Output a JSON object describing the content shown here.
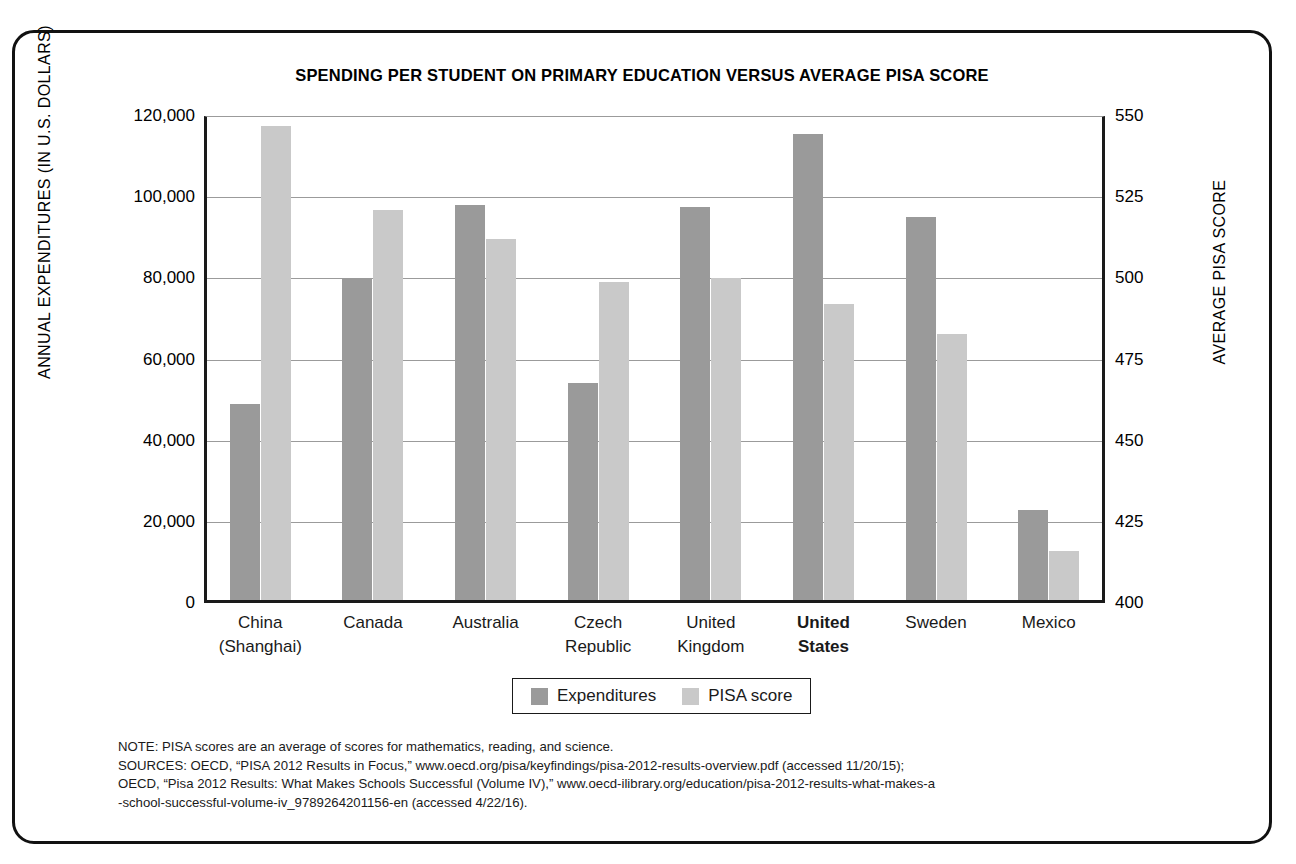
{
  "chart_data": {
    "type": "bar",
    "title": "SPENDING PER STUDENT ON PRIMARY EDUCATION  VERSUS AVERAGE PISA SCORE",
    "categories": [
      "China\n(Shanghai)",
      "Canada",
      "Australia",
      "Czech\nRepublic",
      "United\nKingdom",
      "United\nStates",
      "Sweden",
      "Mexico"
    ],
    "category_lines": [
      [
        "China",
        "(Shanghai)"
      ],
      [
        "Canada",
        ""
      ],
      [
        "Australia",
        ""
      ],
      [
        "Czech",
        "Republic"
      ],
      [
        "United",
        "Kingdom"
      ],
      [
        "United",
        "States"
      ],
      [
        "Sweden",
        ""
      ],
      [
        "Mexico",
        ""
      ]
    ],
    "highlighted_category": "United States",
    "series": [
      {
        "name": "Expenditures",
        "axis": "left",
        "color": "#9a9a9a",
        "values": [
          49000,
          80000,
          98000,
          54300,
          97500,
          115500,
          95000,
          22800
        ]
      },
      {
        "name": "PISA score",
        "axis": "right",
        "color": "#c9c9c9",
        "values": [
          547,
          521,
          512,
          499,
          500,
          492,
          483,
          416
        ]
      }
    ],
    "xlabel": "",
    "ylabel": "ANNUAL EXPENDITURES (IN U.S. DOLLARS)",
    "ylabel_right": "AVERAGE PISA SCORE",
    "ylim": [
      0,
      120000
    ],
    "yticks": [
      "0",
      "20,000",
      "40,000",
      "60,000",
      "80,000",
      "100,000",
      "120,000"
    ],
    "ytick_values": [
      0,
      20000,
      40000,
      60000,
      80000,
      100000,
      120000
    ],
    "ylim_right": [
      400,
      550
    ],
    "yticks_right": [
      "400",
      "425",
      "450",
      "475",
      "500",
      "525",
      "550"
    ],
    "ytick_values_right": [
      400,
      425,
      450,
      475,
      500,
      525,
      550
    ],
    "grid": true,
    "legend_position": "bottom-center"
  },
  "legend": {
    "items": [
      {
        "label": "Expenditures",
        "color": "#9a9a9a"
      },
      {
        "label": "PISA score",
        "color": "#c9c9c9"
      }
    ]
  },
  "notes": {
    "line1": "NOTE: PISA scores are an average of scores for mathematics, reading, and science.",
    "line2": "SOURCES: OECD, “PISA 2012 Results in Focus,” www.oecd.org/pisa/keyfindings/pisa-2012-results-overview.pdf (accessed 11/20/15);",
    "line3": "OECD, “Pisa 2012 Results: What Makes Schools Successful (Volume IV),” www.oecd-ilibrary.org/education/pisa-2012-results-what-makes-a",
    "line4": "-school-successful-volume-iv_9789264201156-en (accessed 4/22/16)."
  },
  "colors": {
    "expenditures": "#9a9a9a",
    "pisa": "#c9c9c9",
    "frame": "#111111",
    "grid": "#9b9b9b"
  }
}
